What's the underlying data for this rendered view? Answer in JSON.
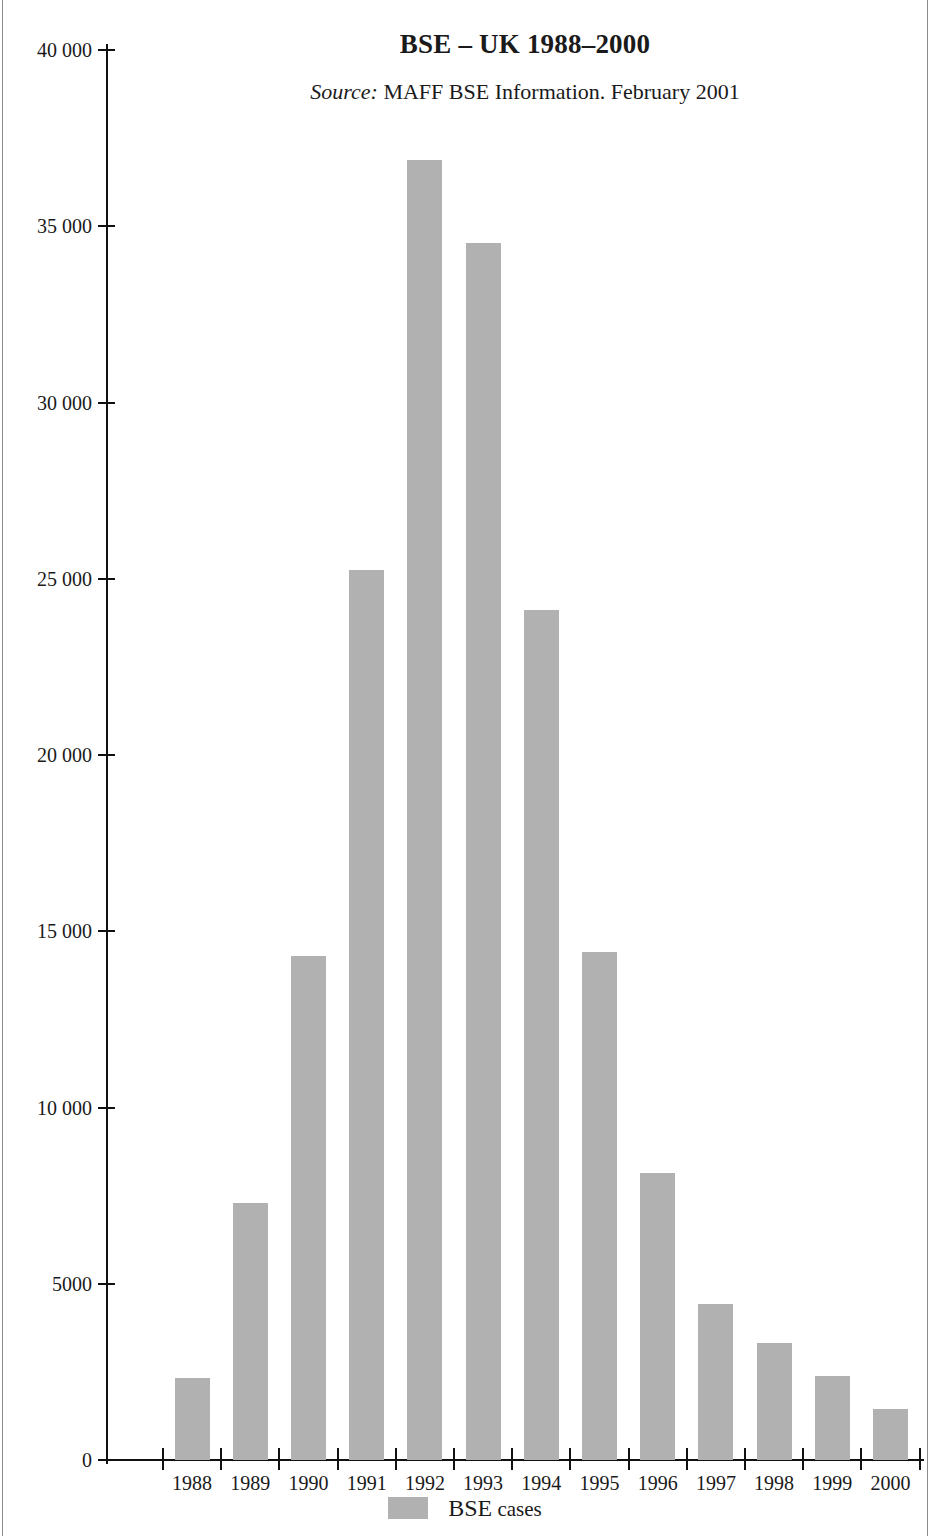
{
  "chart_data": {
    "type": "bar",
    "title": "BSE – UK 1988–2000",
    "subtitle_label": "Source:",
    "subtitle_text": " MAFF BSE Information. February 2001",
    "xlabel": "",
    "ylabel": "",
    "categories": [
      "1988",
      "1989",
      "1990",
      "1991",
      "1992",
      "1993",
      "1994",
      "1995",
      "1996",
      "1997",
      "1998",
      "1999",
      "2000"
    ],
    "values": [
      2330,
      7290,
      14300,
      25250,
      36880,
      34525,
      24110,
      14420,
      8140,
      4430,
      3320,
      2385,
      1450
    ],
    "series": [
      {
        "name": "BSE cases",
        "values": [
          2330,
          7290,
          14300,
          25250,
          36880,
          34525,
          24110,
          14420,
          8140,
          4430,
          3320,
          2385,
          1450
        ]
      }
    ],
    "ylim": [
      0,
      40000
    ],
    "yticks": [
      0,
      5000,
      10000,
      15000,
      20000,
      25000,
      30000,
      35000,
      40000
    ],
    "ytick_labels": [
      "0",
      "5000",
      "10 000",
      "15 000",
      "20 000",
      "25 000",
      "30 000",
      "35 000",
      "40 000"
    ],
    "grid": false,
    "legend": {
      "position": "bottom-center",
      "entries": [
        {
          "label_main": "BSE",
          "label_sub": " cases",
          "color": "#b1b1b1"
        }
      ]
    },
    "colors": {
      "bar": "#b1b1b1",
      "axis": "#111111",
      "text": "#1a1a1a",
      "background": "#ffffff"
    }
  }
}
